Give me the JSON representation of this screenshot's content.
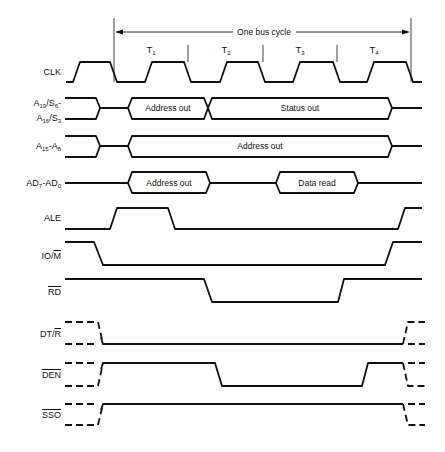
{
  "bus_cycle": {
    "label": "One bus cycle",
    "states": [
      {
        "name": "T",
        "sub": "1"
      },
      {
        "name": "T",
        "sub": "2"
      },
      {
        "name": "T",
        "sub": "3"
      },
      {
        "name": "T",
        "sub": "4"
      }
    ]
  },
  "signals": [
    {
      "id": "clk",
      "label": "CLK",
      "type": "clock"
    },
    {
      "id": "a19",
      "label_line1": "A19/S6-",
      "label_line2": "A16/S3",
      "type": "bus",
      "segments": [
        "Address out",
        "Status out"
      ]
    },
    {
      "id": "a15",
      "label": "A15-A8",
      "type": "bus",
      "segments": [
        "Address out"
      ]
    },
    {
      "id": "ad7",
      "label": "AD7-AD0",
      "type": "bus",
      "segments": [
        "Address out",
        "Data read"
      ]
    },
    {
      "id": "ale",
      "label": "ALE",
      "type": "digital"
    },
    {
      "id": "iom",
      "label": "IO/M",
      "type": "digital"
    },
    {
      "id": "rd",
      "label": "RD",
      "type": "digital",
      "active_low": true
    },
    {
      "id": "dtr",
      "label": "DT/R",
      "type": "digital"
    },
    {
      "id": "den",
      "label": "DEN",
      "type": "digital",
      "active_low": true
    },
    {
      "id": "sso",
      "label": "SSO",
      "type": "digital",
      "active_low": true
    }
  ],
  "colors": {
    "line": "#111111",
    "background": "#ffffff"
  }
}
